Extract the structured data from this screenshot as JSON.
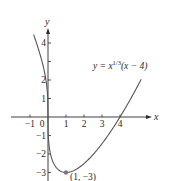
{
  "chart_data": {
    "type": "line",
    "title": "",
    "function_label": {
      "prefix": "y = x",
      "exponent": "1/3",
      "suffix": "(x − 4)"
    },
    "xlabel": "x",
    "ylabel": "y",
    "x_ticks": [
      -1,
      0,
      1,
      2,
      3,
      4
    ],
    "x_tick_labels": [
      "−1",
      "0",
      "1",
      "2",
      "3",
      "4"
    ],
    "y_ticks": [
      -3,
      -2,
      -1,
      1,
      2,
      3,
      4
    ],
    "y_tick_labels": [
      "−3",
      "−2",
      "−1",
      "1",
      "2",
      "",
      "4"
    ],
    "xlim": [
      -1.5,
      5.6
    ],
    "ylim": [
      -3.5,
      4.9
    ],
    "grid": false,
    "series": [
      {
        "name": "y = x^(1/3)(x − 4)",
        "x": [
          -0.8,
          -0.6,
          -0.4,
          -0.2,
          -0.1,
          0,
          0.05,
          0.1,
          0.2,
          0.4,
          0.6,
          0.8,
          1,
          1.5,
          2,
          2.5,
          3,
          3.5,
          4,
          4.5,
          5,
          5.2
        ],
        "y": [
          4.46,
          3.91,
          3.25,
          2.46,
          1.89,
          0,
          -1.47,
          -1.81,
          -2.22,
          -2.62,
          -2.84,
          -2.97,
          -3,
          -2.86,
          -2.52,
          -2.03,
          -1.44,
          -0.76,
          0,
          0.83,
          1.71,
          2.08
        ]
      }
    ],
    "annotations": [
      {
        "x": 1,
        "y": -3,
        "text": "(1, −3)",
        "marker": "point"
      }
    ]
  },
  "colors": {
    "axis": "#2a2a2a",
    "curve": "#555555",
    "point": "#7a7a7a"
  }
}
